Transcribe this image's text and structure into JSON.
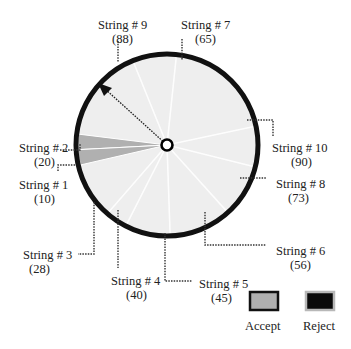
{
  "diagram": {
    "title": "",
    "colors": {
      "disc_fill": "#eeeeee",
      "rim": "#111111",
      "accept": "#b0b0b0",
      "reject": "#0a0a0a"
    },
    "strings": [
      {
        "id": "string-9",
        "label": "String # 9",
        "value": "(88)",
        "angle_deg": 112
      },
      {
        "id": "string-7",
        "label": "String # 7",
        "value": "(65)",
        "angle_deg": 84
      },
      {
        "id": "string-10",
        "label": "String # 10",
        "value": "(90)",
        "angle_deg": 12
      },
      {
        "id": "string-8",
        "label": "String # 8",
        "value": "(73)",
        "angle_deg": -14
      },
      {
        "id": "string-6",
        "label": "String # 6",
        "value": "(56)",
        "angle_deg": -48
      },
      {
        "id": "string-5",
        "label": "String # 5",
        "value": "(45)",
        "angle_deg": -88
      },
      {
        "id": "string-4",
        "label": "String # 4",
        "value": "(40)",
        "angle_deg": -117
      },
      {
        "id": "string-3",
        "label": "String # 3",
        "value": "(28)",
        "angle_deg": -131
      },
      {
        "id": "string-2",
        "label": "String # 2",
        "value": "(20)",
        "angle_deg": 178,
        "status": "accept"
      },
      {
        "id": "string-1",
        "label": "String # 1",
        "value": "(10)",
        "angle_deg": 188,
        "status": "accept"
      }
    ],
    "pointer_angle_deg": 136,
    "legend": [
      {
        "label": "Accept",
        "key": "accept"
      },
      {
        "label": "Reject",
        "key": "reject"
      }
    ]
  }
}
